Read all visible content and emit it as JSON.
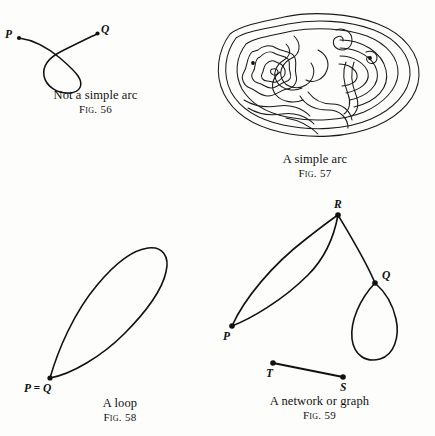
{
  "page": {
    "background_color": "#fdfdfc",
    "ink_color": "#111111",
    "width": 435,
    "height": 436
  },
  "figures": [
    {
      "id": "fig56",
      "caption_title": "Not a simple arc",
      "caption_fig": "Fig. 56",
      "description": "An open curve from P to Q that crosses itself forming a loop",
      "vertices": [
        {
          "label": "P",
          "x": 18,
          "y": 38
        },
        {
          "label": "Q",
          "x": 98,
          "y": 33
        }
      ]
    },
    {
      "id": "fig57",
      "caption_title": "A simple arc",
      "caption_fig": "Fig. 57",
      "description": "A long labyrinth-like non self-intersecting curve with spirals",
      "vertices": [
        {
          "label": "P",
          "x": 253,
          "y": 63
        },
        {
          "label": "Q",
          "x": 370,
          "y": 58
        }
      ]
    },
    {
      "id": "fig58",
      "caption_title": "A loop",
      "caption_fig": "Fig. 58",
      "description": "A closed teardrop curve whose start and end points coincide",
      "vertices": [
        {
          "label": "P = Q",
          "x": 50,
          "y": 378
        }
      ]
    },
    {
      "id": "fig59",
      "caption_title": "A network or graph",
      "caption_fig": "Fig. 59",
      "description": "Graph with vertices P, R, Q, T, S; double edge P-R, edge R-Q, self loop at Q, separate edge T-S",
      "vertices": [
        {
          "label": "R",
          "x": 338,
          "y": 215
        },
        {
          "label": "Q",
          "x": 375,
          "y": 283
        },
        {
          "label": "P",
          "x": 232,
          "y": 326
        },
        {
          "label": "T",
          "x": 273,
          "y": 363
        },
        {
          "label": "S",
          "x": 343,
          "y": 377
        }
      ],
      "edges": [
        {
          "from": "P",
          "to": "R",
          "kind": "arc-upper"
        },
        {
          "from": "P",
          "to": "R",
          "kind": "arc-lower"
        },
        {
          "from": "R",
          "to": "Q",
          "kind": "straight"
        },
        {
          "from": "Q",
          "to": "Q",
          "kind": "self-loop"
        },
        {
          "from": "T",
          "to": "S",
          "kind": "straight"
        }
      ]
    }
  ]
}
